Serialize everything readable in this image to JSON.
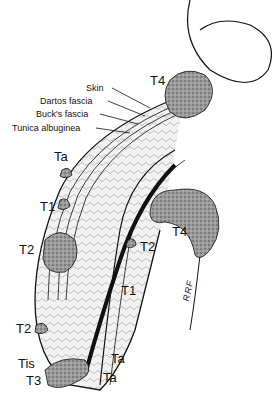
{
  "diagram": {
    "layer_labels": [
      {
        "id": "skin",
        "text": "Skin"
      },
      {
        "id": "dartos",
        "text": "Dartos fascia"
      },
      {
        "id": "bucks",
        "text": "Buck's fascia"
      },
      {
        "id": "tunica",
        "text": "Tunica albuginea"
      }
    ],
    "stage_labels": [
      {
        "id": "t4-top",
        "text": "T4"
      },
      {
        "id": "ta-upper",
        "text": "Ta"
      },
      {
        "id": "t1-left",
        "text": "T1"
      },
      {
        "id": "t2-left",
        "text": "T2"
      },
      {
        "id": "t2-mid",
        "text": "T2"
      },
      {
        "id": "t4-right",
        "text": "T4"
      },
      {
        "id": "t1-right",
        "text": "T1"
      },
      {
        "id": "t2-lower",
        "text": "T2"
      },
      {
        "id": "tis",
        "text": "Tis"
      },
      {
        "id": "t3",
        "text": "T3"
      },
      {
        "id": "ta-lower1",
        "text": "Ta"
      },
      {
        "id": "ta-lower2",
        "text": "Ta"
      }
    ],
    "signature": "RRF",
    "colors": {
      "ink": "#111111",
      "tumor": "#8a8a8a",
      "tissue": "#e6e6e6"
    }
  }
}
